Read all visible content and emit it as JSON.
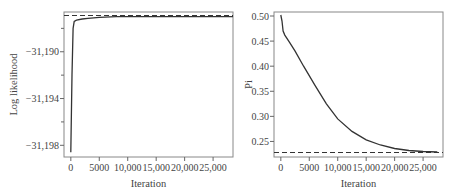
{
  "chart_data": [
    {
      "type": "line",
      "title": "",
      "xlabel": "Iteration",
      "ylabel": "Log likelihood",
      "xlim": [
        -1200,
        28500
      ],
      "ylim": [
        -31199,
        -31186.6
      ],
      "x_ticks": [
        0,
        5000,
        10000,
        15000,
        20000,
        25000
      ],
      "x_tick_labels": [
        "0",
        "5000",
        "10,000",
        "15,000",
        "20,000",
        "25,000"
      ],
      "y_ticks": [
        -31190,
        -31194,
        -31198
      ],
      "y_tick_labels": [
        "−31,190",
        "−31,194",
        "−31,198"
      ],
      "grid": false,
      "series": [
        {
          "name": "log-likelihood trace",
          "style": "solid",
          "x": [
            0,
            200,
            400,
            600,
            1000,
            2000,
            3000,
            5000,
            8000,
            12000,
            16000,
            20000,
            25000,
            28500
          ],
          "y": [
            -31198.6,
            -31192.0,
            -31188.0,
            -31187.4,
            -31187.3,
            -31187.2,
            -31187.15,
            -31187.05,
            -31187.0,
            -31187.0,
            -31187.0,
            -31187.0,
            -31187.0,
            -31187.0
          ]
        },
        {
          "name": "reference",
          "style": "dashed",
          "x": [
            -1200,
            28500
          ],
          "y": [
            -31186.9,
            -31186.9
          ]
        }
      ]
    },
    {
      "type": "line",
      "title": "",
      "xlabel": "Iteration",
      "ylabel": "Pi",
      "xlim": [
        -1200,
        28500
      ],
      "ylim": [
        0.219,
        0.508
      ],
      "x_ticks": [
        0,
        5000,
        10000,
        15000,
        20000,
        25000
      ],
      "x_tick_labels": [
        "0",
        "5000",
        "10,000",
        "15,000",
        "20,000",
        "25,000"
      ],
      "y_ticks": [
        0.25,
        0.3,
        0.35,
        0.4,
        0.45,
        0.5
      ],
      "y_tick_labels": [
        "0.25",
        "0.30",
        "0.35",
        "0.40",
        "0.45",
        "0.50"
      ],
      "grid": false,
      "series": [
        {
          "name": "Pi trace",
          "style": "solid",
          "x": [
            0,
            200,
            400,
            700,
            1500,
            2500,
            4000,
            6000,
            8000,
            10000,
            12500,
            15000,
            17500,
            20000,
            22500,
            25000,
            27500
          ],
          "y": [
            0.502,
            0.49,
            0.47,
            0.462,
            0.448,
            0.43,
            0.4,
            0.362,
            0.325,
            0.295,
            0.27,
            0.253,
            0.243,
            0.236,
            0.232,
            0.23,
            0.229
          ]
        },
        {
          "name": "reference",
          "style": "dashed",
          "x": [
            -1200,
            28500
          ],
          "y": [
            0.228,
            0.228
          ]
        }
      ]
    }
  ]
}
